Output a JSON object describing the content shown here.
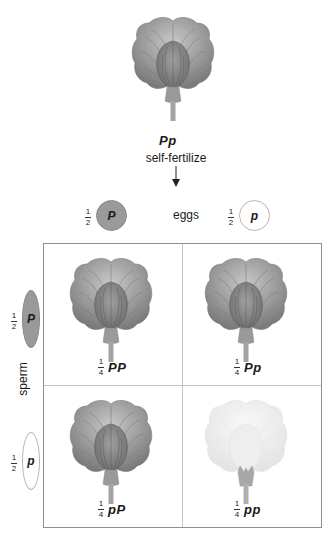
{
  "parent": {
    "genotype": "Pp",
    "caption": "self-fertilize",
    "arrow": "down-arrow"
  },
  "eggs": {
    "label": "eggs",
    "gametes": [
      {
        "fraction_num": "1",
        "fraction_den": "2",
        "allele": "P",
        "fill": "#9a9a9a"
      },
      {
        "fraction_num": "1",
        "fraction_den": "2",
        "allele": "p",
        "fill": "#ffffff"
      }
    ]
  },
  "sperm": {
    "label": "sperm",
    "gametes": [
      {
        "fraction_num": "1",
        "fraction_den": "2",
        "allele": "P",
        "fill": "#9a9a9a"
      },
      {
        "fraction_num": "1",
        "fraction_den": "2",
        "allele": "p",
        "fill": "#ffffff"
      }
    ]
  },
  "punnett": {
    "cells": [
      {
        "fraction_num": "1",
        "fraction_den": "4",
        "genotype": "PP",
        "phenotype": "purple"
      },
      {
        "fraction_num": "1",
        "fraction_den": "4",
        "genotype": "Pp",
        "phenotype": "purple"
      },
      {
        "fraction_num": "1",
        "fraction_den": "4",
        "genotype": "pP",
        "phenotype": "purple"
      },
      {
        "fraction_num": "1",
        "fraction_den": "4",
        "genotype": "pp",
        "phenotype": "white"
      }
    ]
  },
  "colors": {
    "dominant_flower": "#8c8c8c",
    "recessive_flower": "#ececec",
    "grid_border": "#8f8f8f",
    "grid_divider": "#c4c4c4"
  }
}
